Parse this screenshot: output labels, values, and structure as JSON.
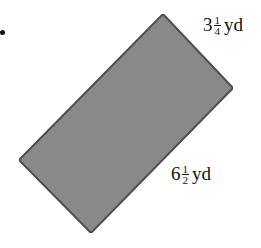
{
  "figure": {
    "shape": "rotated-rectangle",
    "fill_color": "#8c8c8c",
    "stroke_color": "#505050",
    "corners": {
      "top": [
        163,
        14
      ],
      "right": [
        233,
        88
      ],
      "bottom": [
        91,
        233
      ],
      "left": [
        19,
        160
      ]
    }
  },
  "labels": {
    "short_side": {
      "whole": "3",
      "numerator": "1",
      "denominator": "4",
      "unit": "yd"
    },
    "long_side": {
      "whole": "6",
      "numerator": "1",
      "denominator": "2",
      "unit": "yd"
    }
  }
}
